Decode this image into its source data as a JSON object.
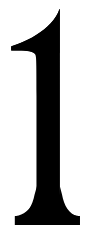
{
  "image": {
    "kind": "numeral-glyph",
    "character": "1",
    "description": "Large black serif numeral one on a plain white background",
    "width_px": 94,
    "height_px": 234
  },
  "colors": {
    "background": "#ffffff",
    "glyph": "#000000"
  },
  "glyph": {
    "label": "1",
    "style": "serif",
    "weight": "bold",
    "bbox": {
      "x": 11,
      "y": 9,
      "width": 69,
      "height": 216
    },
    "parts": {
      "flag_label": "flag",
      "stem_label": "stem",
      "foot_serif_label": "foot-serif"
    },
    "path": "M 59.5 9.2 C 58.0 14.0 55.0 18.6 50.5 23.4 C 43.0 31.4 31.0 39.2 17.5 44.2 L 11.2 46.4 L 11.2 50.6 L 18.0 50.6 C 27.5 50.6 32.5 51.6 34.8 54.0 C 36.4 55.7 36.6 58.6 36.6 96.0 L 36.6 189.5 C 35.2 199.0 32.5 205.6 28.6 209.6 C 25.6 212.7 22.2 214.6 18.6 215.4 L 14.9 216.2 L 14.9 224.9 L 79.8 224.9 L 79.8 216.2 L 76.0 215.4 C 69.0 213.9 64.3 209.7 61.6 202.4 C 60.3 198.8 59.8 195.0 59.6 189.5 L 59.6 9.2 Z"
  }
}
